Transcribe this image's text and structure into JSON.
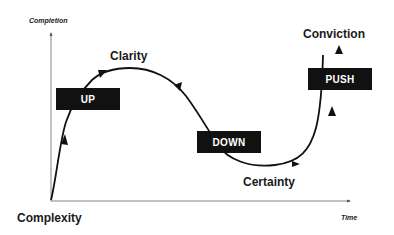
{
  "diagram": {
    "axes": {
      "y_label": "Completion",
      "x_label": "Time",
      "origin_label": "Complexity"
    },
    "stages": {
      "clarity": "Clarity",
      "certainty": "Certainty",
      "conviction": "Conviction"
    },
    "boxes": {
      "up": "UP",
      "down": "DOWN",
      "push": "PUSH"
    },
    "colors": {
      "line": "#111111",
      "box_bg": "#111111",
      "box_text": "#ffffff",
      "axis": "#555555",
      "background": "#ffffff"
    }
  }
}
